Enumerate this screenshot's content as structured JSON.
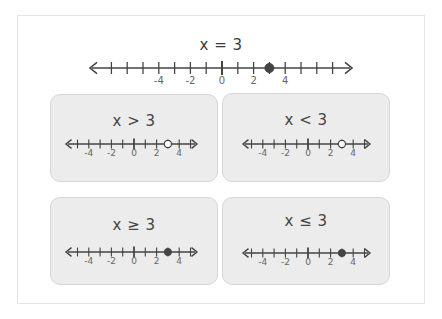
{
  "main": {
    "title": "x = 3",
    "point": 3,
    "point_style": "closed",
    "tick_range": [
      -8,
      7
    ],
    "labels": [
      "-4",
      "-2",
      "0",
      "2",
      "4"
    ]
  },
  "cards": [
    {
      "title": "x > 3",
      "point": 3,
      "point_style": "open",
      "labels": [
        "-4",
        "-2",
        "0",
        "2",
        "4"
      ]
    },
    {
      "title": "x < 3",
      "point": 3,
      "point_style": "open",
      "labels": [
        "-4",
        "-2",
        "0",
        "2",
        "4"
      ]
    },
    {
      "title": "x ≥ 3",
      "point": 3,
      "point_style": "closed",
      "labels": [
        "-4",
        "-2",
        "0",
        "2",
        "4"
      ]
    },
    {
      "title": "x ≤ 3",
      "point": 3,
      "point_style": "closed",
      "labels": [
        "-4",
        "-2",
        "0",
        "2",
        "4"
      ]
    }
  ],
  "colors": {
    "line": "#444444",
    "card_bg": "#ececec",
    "card_border": "#d6d6d6",
    "point_fill": "#444444",
    "open_point_fill": "#ffffff"
  }
}
